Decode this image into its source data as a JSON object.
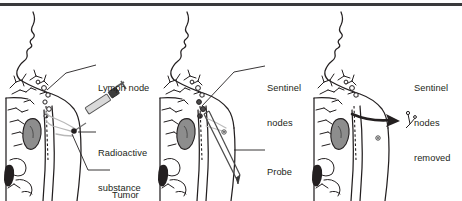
{
  "figure": {
    "top_rule_color": "#3a3a3c",
    "background_color": "#ffffff",
    "ink_color": "#231f20",
    "organ_shade_color": "#8d8d8d",
    "panel_count": 3
  },
  "panels": [
    {
      "id": "panel-1",
      "name": "injection-stage",
      "labels": [
        {
          "id": "lymph-node",
          "lines": [
            "Lymph node"
          ],
          "x": 98,
          "y": 50
        },
        {
          "id": "radioactive-substance-or-dye",
          "lines": [
            "Radioactive",
            "substance",
            "or dye"
          ],
          "x": 98,
          "y": 115
        },
        {
          "id": "tumor",
          "lines": [
            "Tumor"
          ],
          "x": 112,
          "y": 157
        }
      ]
    },
    {
      "id": "panel-2",
      "name": "probe-detection-stage",
      "labels": [
        {
          "id": "sentinel-nodes",
          "lines": [
            "Sentinel",
            "nodes"
          ],
          "x": 113,
          "y": 50
        },
        {
          "id": "probe",
          "lines": [
            "Probe"
          ],
          "x": 113,
          "y": 134
        }
      ]
    },
    {
      "id": "panel-3",
      "name": "nodes-removed-stage",
      "labels": [
        {
          "id": "sentinel-nodes-removed",
          "lines": [
            "Sentinel",
            "nodes",
            "removed"
          ],
          "x": 106,
          "y": 50
        }
      ]
    }
  ]
}
